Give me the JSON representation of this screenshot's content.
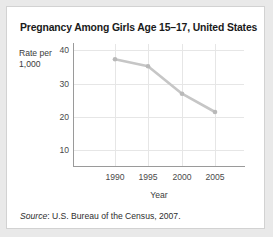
{
  "figure": {
    "title": "Pregnancy Among Girls Age 15–17, United States",
    "source_prefix": "Source",
    "source_text": ": U.S. Bureau of the Census, 2007."
  },
  "axes": {
    "ylabel_line1": "Rate per",
    "ylabel_line2": "1,000",
    "xlabel": "Year",
    "yticks": [
      "40",
      "30",
      "20",
      "10"
    ],
    "xticks": [
      "1990",
      "1995",
      "2000",
      "2005"
    ]
  },
  "colors": {
    "line": "#c6c6c6",
    "marker": "#b9b9b9",
    "grid": "#e6e6e6",
    "axis": "#9a9a9a",
    "card_border": "#d2d2d2",
    "page_background": "#e9e9e9",
    "title_text": "#1a1a1a"
  },
  "chart_data": {
    "type": "line",
    "title": "Pregnancy Among Girls Age 15–17, United States",
    "xlabel": "Year",
    "ylabel": "Rate per 1,000",
    "x": [
      1990,
      1995,
      2000,
      2005
    ],
    "categories": [
      "1990",
      "1995",
      "2000",
      "2005"
    ],
    "values": [
      37.2,
      35.1,
      26.9,
      21.4
    ],
    "series": [
      {
        "name": "Pregnancy rate per 1,000 girls age 15-17",
        "values": [
          37.2,
          35.1,
          26.9,
          21.4
        ]
      }
    ],
    "xlim": [
      1987,
      2010
    ],
    "ylim": [
      0,
      42
    ],
    "ytick_values": [
      40,
      30,
      20,
      10
    ],
    "xtick_values": [
      1990,
      1995,
      2000,
      2005
    ],
    "grid": true,
    "legend": false,
    "markers": true,
    "source": "Source: U.S. Bureau of the Census, 2007."
  }
}
